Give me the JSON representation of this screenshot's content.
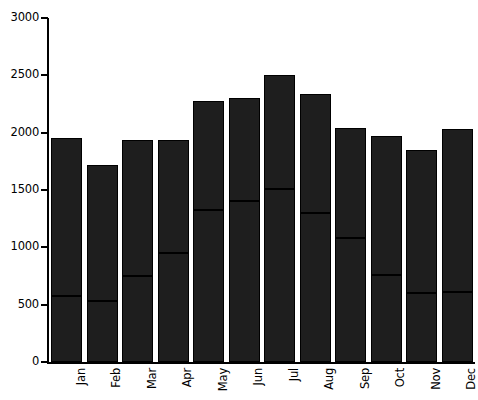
{
  "chart_data": {
    "type": "bar",
    "subtype": "stacked-bar",
    "title": "",
    "subtitle": "",
    "xlabel": "",
    "ylabel": "",
    "categories": [
      "Jan",
      "Feb",
      "Mar",
      "Apr",
      "May",
      "Jun",
      "Jul",
      "Aug",
      "Sep",
      "Oct",
      "Nov",
      "Dec"
    ],
    "series": [
      {
        "name": "lower",
        "values": [
          575,
          530,
          750,
          950,
          1325,
          1405,
          1510,
          1300,
          1080,
          760,
          600,
          610
        ]
      },
      {
        "name": "upper",
        "values": [
          1375,
          1185,
          1190,
          990,
          950,
          895,
          990,
          1040,
          965,
          1210,
          1250,
          1425
        ]
      }
    ],
    "totals": [
      1950,
      1715,
      1940,
      1940,
      2275,
      2300,
      2500,
      2340,
      2045,
      1970,
      1850,
      2035
    ],
    "ylim": [
      0,
      3000
    ],
    "ytick_values": [
      0,
      500,
      1000,
      1500,
      2000,
      2500,
      3000
    ],
    "ytick_labels": [
      "0",
      "500",
      "1000",
      "1500",
      "2000",
      "2500",
      "3000"
    ],
    "grid": false,
    "legend": false,
    "legend_position": "none",
    "xtick_rotation": 90,
    "colors": {
      "bar_fill": "#1e1e1e",
      "bar_edge": "#000000",
      "axis": "#000000",
      "background": "#ffffff",
      "text": "#000000"
    }
  }
}
